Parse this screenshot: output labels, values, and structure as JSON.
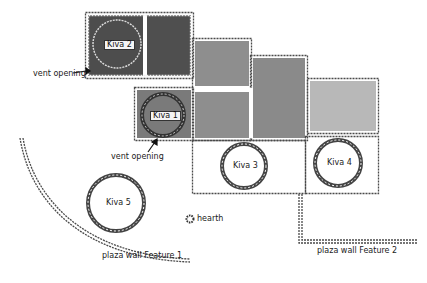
{
  "diagram": {
    "type": "archaeological site plan",
    "colors": {
      "dark_room": "#4d4d4d",
      "medium_room": "#8e8e8e",
      "medium_dark_room": "#7a7a7a",
      "light_room": "#b8b8b8",
      "wall": "#555555",
      "background": "#ffffff"
    },
    "kivas": [
      {
        "id": "kiva-1",
        "label": "Kiva 1"
      },
      {
        "id": "kiva-2",
        "label": "Kiva 2"
      },
      {
        "id": "kiva-3",
        "label": "Kiva 3"
      },
      {
        "id": "kiva-4",
        "label": "Kiva 4"
      },
      {
        "id": "kiva-5",
        "label": "Kiva 5"
      }
    ],
    "annotations": {
      "vent_opening_1": "vent opening",
      "vent_opening_2": "vent opening",
      "hearth": "hearth",
      "plaza_wall_1": "plaza wall  Feature 1",
      "plaza_wall_2": "plaza wall  Feature 2"
    },
    "legend_icons": {
      "hearth": "hearth-icon"
    }
  }
}
